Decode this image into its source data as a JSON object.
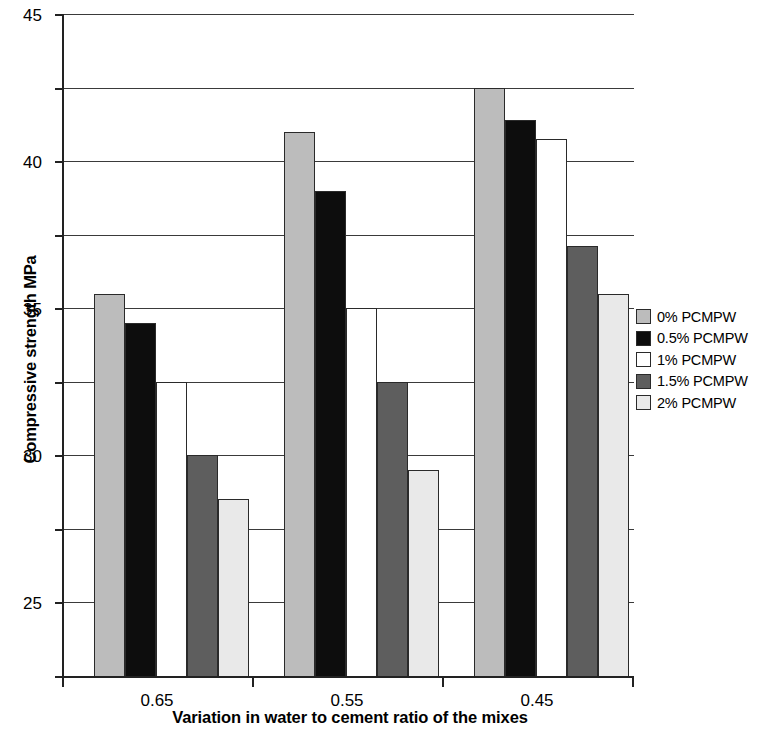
{
  "chart_data": {
    "type": "bar",
    "title": "",
    "xlabel": "Variation in water to cement ratio of the mixes",
    "ylabel": "Compressive strength MPa",
    "categories": [
      "0.65",
      "0.55",
      "0.45"
    ],
    "ylim": [
      0,
      45
    ],
    "yticks": [
      0,
      5,
      10,
      15,
      20,
      25,
      30,
      35,
      40,
      45
    ],
    "ytick_labels": [
      "0",
      "5",
      "10",
      "15",
      "20",
      "25",
      "30",
      "35",
      "40",
      "45"
    ],
    "grid": true,
    "legend_position": "right",
    "series": [
      {
        "name": "0% PCMPW",
        "color": "#bcbcbc",
        "values": [
          26,
          37,
          40
        ]
      },
      {
        "name": "0.5% PCMPW",
        "color": "#0d0d0d",
        "values": [
          24,
          33,
          37.8
        ]
      },
      {
        "name": "1% PCMPW",
        "color": "#ffffff",
        "values": [
          20,
          25,
          36.5
        ]
      },
      {
        "name": "1.5% PCMPW",
        "color": "#5e5e5e",
        "values": [
          15,
          20,
          29.2
        ]
      },
      {
        "name": "2% PCMPW",
        "color": "#e9e9e9",
        "values": [
          12,
          14,
          26
        ]
      }
    ]
  },
  "axis": {
    "y_title": "Compressive strength MPa",
    "x_title": "Variation in water to cement ratio of the mixes"
  },
  "legend": {
    "items": [
      {
        "label": "0% PCMPW",
        "color": "#bcbcbc"
      },
      {
        "label": "0.5% PCMPW",
        "color": "#0d0d0d"
      },
      {
        "label": "1% PCMPW",
        "color": "#ffffff"
      },
      {
        "label": "1.5% PCMPW",
        "color": "#5e5e5e"
      },
      {
        "label": "2% PCMPW",
        "color": "#e9e9e9"
      }
    ]
  }
}
